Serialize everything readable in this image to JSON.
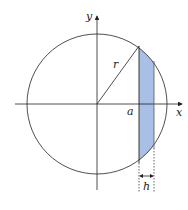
{
  "diagram": {
    "labels": {
      "x_axis": "x",
      "y_axis": "y",
      "radius": "r",
      "a": "a",
      "h": "h"
    },
    "colors": {
      "shade": "#a9bfe6",
      "line": "#222222"
    }
  }
}
